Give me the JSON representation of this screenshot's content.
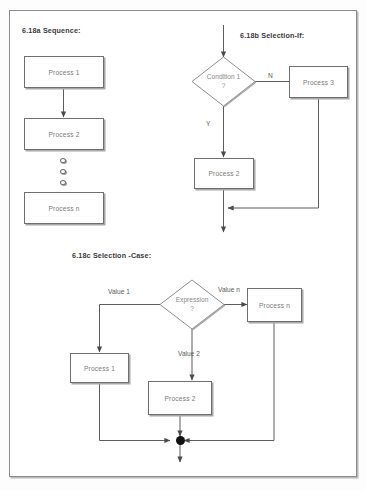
{
  "sections": [
    {
      "id": "sequence",
      "label": "6.18a   Sequence:",
      "nodes": [
        {
          "name": "process-1",
          "text": "Process 1"
        },
        {
          "name": "process-2",
          "text": "Process 2"
        },
        {
          "name": "process-n",
          "text": "Process n"
        }
      ],
      "ellipsis_dots": 3
    },
    {
      "id": "selection-if",
      "label": "6.18b   Selection-If:",
      "decision": {
        "line1": "Condition 1",
        "line2": "?"
      },
      "nodes": [
        {
          "name": "process-3",
          "text": "Process 3"
        },
        {
          "name": "process-2",
          "text": "Process 2"
        }
      ],
      "edge_labels": {
        "no": "N",
        "yes": "Y"
      }
    },
    {
      "id": "selection-case",
      "label": "6.18c   Selection -Case:",
      "decision": {
        "line1": "Expression",
        "line2": "?"
      },
      "nodes": [
        {
          "name": "process-1",
          "text": "Process 1"
        },
        {
          "name": "process-2",
          "text": "Process 2"
        },
        {
          "name": "process-n",
          "text": "Process n"
        }
      ],
      "edge_labels": {
        "value_1": "Value 1",
        "value_2": "Value 2",
        "value_n": "Value n"
      }
    }
  ],
  "colors": {
    "line": "#6f6f6f",
    "box_border": "#6f6f6f",
    "text": "#7a7a7a",
    "label_text": "#3a3a3a",
    "junction": "#111111",
    "page_frame": "#8d8d8d"
  }
}
